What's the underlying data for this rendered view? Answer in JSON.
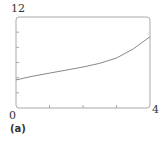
{
  "chart_data": {
    "type": "line",
    "title": "",
    "subfigure_label": "(a)",
    "xlabel": "",
    "ylabel": "",
    "xlim": [
      0,
      4
    ],
    "ylim": [
      0,
      12
    ],
    "x_tick_labels": [
      "0",
      "4"
    ],
    "y_tick_labels": [
      "12"
    ],
    "x_ticks": [
      0,
      1,
      2,
      3,
      4
    ],
    "y_ticks": [
      0,
      2,
      4,
      6,
      8,
      10,
      12
    ],
    "grid": false,
    "legend": null,
    "series": [
      {
        "name": "curve",
        "x": [
          0,
          0.5,
          1,
          1.5,
          2,
          2.5,
          3,
          3.5,
          4
        ],
        "y": [
          3.7,
          4.2,
          4.6,
          5.0,
          5.4,
          5.9,
          6.6,
          7.8,
          9.4
        ]
      }
    ],
    "colors": {
      "axes": "#999999",
      "line": "#777777"
    }
  }
}
